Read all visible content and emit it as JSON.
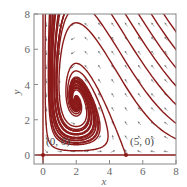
{
  "figure": {
    "type": "phase-portrait",
    "x_axis": {
      "label": "x",
      "ticks": [
        "0",
        "2",
        "4",
        "6",
        "8"
      ],
      "range": [
        -0.3,
        8
      ]
    },
    "y_axis": {
      "label": "y",
      "ticks": [
        "0",
        "2",
        "4",
        "6",
        "8"
      ],
      "range": [
        -0.5,
        8
      ]
    },
    "equilibria": [
      {
        "label": "(0, 0)",
        "x": 0,
        "y": 0,
        "type": "saddle"
      },
      {
        "label": "(5, 0)",
        "x": 5,
        "y": 0,
        "type": "saddle"
      },
      {
        "label": "",
        "x": 2,
        "y": 3,
        "type": "spiral-sink"
      }
    ],
    "colors": {
      "trajectory": "#8b1a1a",
      "direction_field": "#777777",
      "frame": "#888888"
    }
  }
}
